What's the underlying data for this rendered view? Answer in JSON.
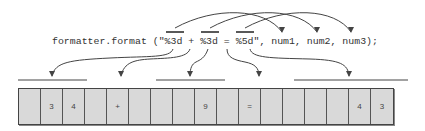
{
  "code": {
    "text": "formatter.format (\"%3d + %3d = %5d\", num1, num2, num3);",
    "specifiers": [
      "%3d",
      "%3d",
      "%5d"
    ],
    "arguments": [
      "num1",
      "num2",
      "num3"
    ]
  },
  "output": {
    "cells": [
      " ",
      "3",
      "4",
      " ",
      "+",
      " ",
      " ",
      " ",
      "9",
      " ",
      "=",
      " ",
      " ",
      " ",
      " ",
      "4",
      "3"
    ],
    "field_groups": [
      {
        "specifier": "%3d",
        "start_cell": 0,
        "end_cell": 2,
        "argument": "num1"
      },
      {
        "specifier": "%3d",
        "start_cell": 6,
        "end_cell": 8,
        "argument": "num2"
      },
      {
        "specifier": "%5d",
        "start_cell": 12,
        "end_cell": 16,
        "argument": "num3"
      }
    ],
    "literal_arrows": [
      {
        "text": " + ",
        "target_cell": 4
      },
      {
        "text": " = ",
        "target_cell": 10
      }
    ]
  },
  "colors": {
    "cell_fill": "#d9d9d9",
    "line": "#444444",
    "text": "#333333"
  }
}
